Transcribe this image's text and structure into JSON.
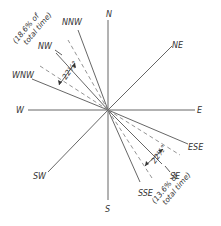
{
  "diagram": {
    "type": "wind-direction-rose",
    "center": {
      "x": 108,
      "y": 110
    },
    "directions": [
      {
        "label": "N"
      },
      {
        "label": "NE"
      },
      {
        "label": "E"
      },
      {
        "label": "ESE"
      },
      {
        "label": "SE"
      },
      {
        "label": "SSE"
      },
      {
        "label": "S"
      },
      {
        "label": "SW"
      },
      {
        "label": "W"
      },
      {
        "label": "WNW"
      },
      {
        "label": "NW"
      },
      {
        "label": "NNW"
      }
    ],
    "annotations": {
      "nw_angle": "22½°",
      "nw_note_line1": "(18.6% of",
      "nw_note_line2": "total time)",
      "se_angle": "22½°",
      "se_note_line1": "(13.6% of",
      "se_note_line2": "total time)"
    },
    "colors": {
      "line": "#555555",
      "dashed": "#888888",
      "text": "#333333",
      "background": "#ffffff"
    }
  }
}
